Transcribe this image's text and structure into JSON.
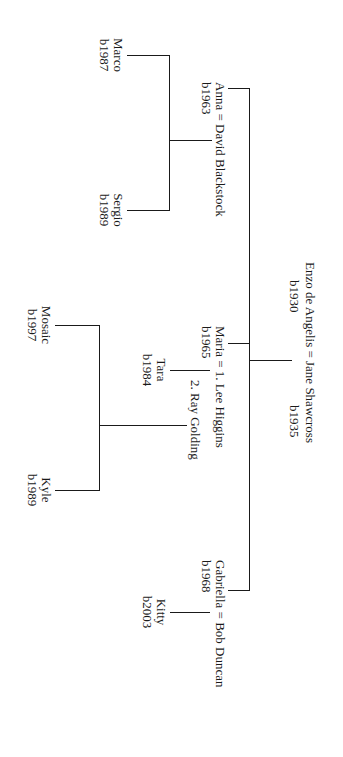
{
  "tree": {
    "root": {
      "couple": "Enzo de Angelis = Jane Shawcross",
      "person1_birth": "b1930",
      "person2_birth": "b1935"
    },
    "children": [
      {
        "couple": "Anna = David Blackstock",
        "birth": "b1963",
        "children": [
          {
            "name": "Marco",
            "birth": "b1987"
          },
          {
            "name": "Sergio",
            "birth": "b1989"
          }
        ]
      },
      {
        "couple": "Maria = 1. Lee Higgins",
        "second_spouse": "2. Ray Golding",
        "birth": "b1965",
        "children_first": [
          {
            "name": "Tara",
            "birth": "b1984"
          }
        ],
        "children_second": [
          {
            "name": "Mosaic",
            "birth": "b1997"
          },
          {
            "name": "Kyle",
            "birth": "b1989"
          }
        ]
      },
      {
        "couple": "Gabriella = Bob Duncan",
        "birth": "b1968",
        "children": [
          {
            "name": "Kitty",
            "birth": "b2003"
          }
        ]
      }
    ]
  },
  "style": {
    "line_color": "#1a1a1a",
    "background": "#ffffff",
    "orientation": "rotated 90deg clockwise"
  }
}
